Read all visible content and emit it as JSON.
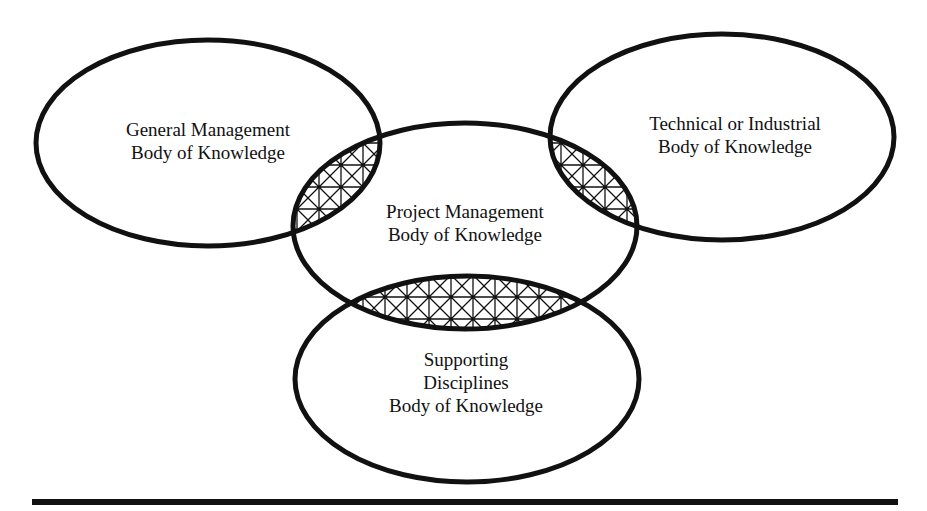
{
  "diagram": {
    "type": "venn",
    "stroke_color": "#111111",
    "background": "#ffffff",
    "sets": [
      {
        "id": "general-management",
        "label_lines": [
          "General Management",
          "Body of Knowledge"
        ]
      },
      {
        "id": "project-management",
        "label_lines": [
          "Project Management",
          "Body of Knowledge"
        ]
      },
      {
        "id": "technical-industrial",
        "label_lines": [
          "Technical or Industrial",
          "Body of Knowledge"
        ]
      },
      {
        "id": "supporting-disciplines",
        "label_lines": [
          "Supporting",
          "Disciplines",
          "Body of Knowledge"
        ]
      }
    ],
    "overlaps": [
      {
        "between": [
          "general-management",
          "project-management"
        ],
        "fill": "crosshatch"
      },
      {
        "between": [
          "project-management",
          "technical-industrial"
        ],
        "fill": "crosshatch"
      },
      {
        "between": [
          "project-management",
          "supporting-disciplines"
        ],
        "fill": "crosshatch"
      }
    ]
  }
}
